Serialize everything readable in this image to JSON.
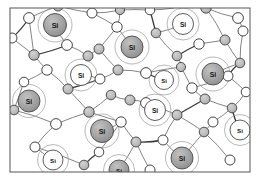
{
  "figure": {
    "atom_label": "Si",
    "frame": {
      "x": 10,
      "y": 8,
      "width": 240,
      "height": 164,
      "stroke": "#555555",
      "fill": "#ffffff"
    },
    "colors": {
      "background": "#ffffff",
      "bond_stroke": "#6e6e6e",
      "bond_stroke_dark": "#3a3a3a",
      "shell_stroke": "#9a9a9a",
      "silicon_fill_dark": "#9e9e9e",
      "silicon_fill_light": "#ffffff",
      "silicon_stroke": "#4a4a4a",
      "dopant_fill": "#b8b8b8",
      "dopant_stroke": "#4a4a4a",
      "hydrogen_fill": "#ffffff",
      "hydrogen_stroke": "#3c3c3c",
      "label_color": "#151515"
    },
    "legend_note": "Large circles labelled Si are silicon atoms; grey small circles and open circles are bonded neighbour sites.",
    "counts": {
      "silicon_filled": 8,
      "silicon_open": 5,
      "small_grey": 23,
      "small_open": 22
    },
    "silicon_atoms": [
      {
        "id": "si-1",
        "cx": 55,
        "cy": 25,
        "r": 11.5,
        "shell": 17,
        "style": "filled"
      },
      {
        "id": "si-2",
        "cx": 132,
        "cy": 47,
        "r": 11.0,
        "shell": 17,
        "style": "filled"
      },
      {
        "id": "si-3",
        "cx": 183,
        "cy": 24,
        "r": 10.5,
        "shell": 16,
        "style": "open"
      },
      {
        "id": "si-4",
        "cx": 81,
        "cy": 75,
        "r": 10.5,
        "shell": 16,
        "style": "open"
      },
      {
        "id": "si-5",
        "cx": 164,
        "cy": 80,
        "r": 9.5,
        "shell": 15,
        "style": "open"
      },
      {
        "id": "si-6",
        "cx": 213,
        "cy": 74,
        "r": 11.0,
        "shell": 17,
        "style": "filled"
      },
      {
        "id": "si-7",
        "cx": 29,
        "cy": 101,
        "r": 11.0,
        "shell": 16.5,
        "style": "filled"
      },
      {
        "id": "si-8",
        "cx": 155,
        "cy": 110,
        "r": 10.5,
        "shell": 16,
        "style": "open"
      },
      {
        "id": "si-9",
        "cx": 102,
        "cy": 131,
        "r": 11.5,
        "shell": 17,
        "style": "filled"
      },
      {
        "id": "si-10",
        "cx": 240,
        "cy": 130,
        "r": 10.0,
        "shell": 15.5,
        "style": "open"
      },
      {
        "id": "si-11",
        "cx": 53,
        "cy": 160,
        "r": 10.0,
        "shell": 15.5,
        "style": "open"
      },
      {
        "id": "si-12",
        "cx": 182,
        "cy": 158,
        "r": 11.0,
        "shell": 16.5,
        "style": "filled"
      },
      {
        "id": "si-13",
        "cx": 119,
        "cy": 170,
        "r": 10.0,
        "shell": 15.5,
        "style": "filled"
      }
    ],
    "grey_sites": [
      {
        "cx": 58,
        "cy": 6,
        "r": 5.0
      },
      {
        "cx": 120,
        "cy": 10,
        "r": 4.6
      },
      {
        "cx": 206,
        "cy": 8,
        "r": 5.2
      },
      {
        "cx": 99,
        "cy": 49,
        "r": 5.0
      },
      {
        "cx": 156,
        "cy": 33,
        "r": 4.8
      },
      {
        "cx": 225,
        "cy": 40,
        "r": 5.0
      },
      {
        "cx": 34,
        "cy": 55,
        "r": 5.2
      },
      {
        "cx": 88,
        "cy": 56,
        "r": 5.0
      },
      {
        "cx": 177,
        "cy": 56,
        "r": 4.8
      },
      {
        "cx": 118,
        "cy": 70,
        "r": 5.0
      },
      {
        "cx": 181,
        "cy": 67,
        "r": 4.6
      },
      {
        "cx": 240,
        "cy": 63,
        "r": 4.8
      },
      {
        "cx": 68,
        "cy": 89,
        "r": 5.0
      },
      {
        "cx": 111,
        "cy": 95,
        "r": 4.8
      },
      {
        "cx": 130,
        "cy": 100,
        "r": 5.0
      },
      {
        "cx": 205,
        "cy": 99,
        "r": 5.0
      },
      {
        "cx": 14,
        "cy": 110,
        "r": 4.8
      },
      {
        "cx": 89,
        "cy": 112,
        "r": 5.2
      },
      {
        "cx": 177,
        "cy": 115,
        "r": 5.0
      },
      {
        "cx": 232,
        "cy": 108,
        "r": 4.8
      },
      {
        "cx": 136,
        "cy": 142,
        "r": 5.0
      },
      {
        "cx": 204,
        "cy": 132,
        "r": 4.8
      },
      {
        "cx": 84,
        "cy": 165,
        "r": 4.8
      }
    ],
    "open_sites": [
      {
        "cx": 29,
        "cy": 18,
        "r": 5.4
      },
      {
        "cx": 92,
        "cy": 13,
        "r": 5.0
      },
      {
        "cx": 150,
        "cy": 10,
        "r": 4.8
      },
      {
        "cx": 238,
        "cy": 18,
        "r": 5.4
      },
      {
        "cx": 12,
        "cy": 38,
        "r": 5.0
      },
      {
        "cx": 67,
        "cy": 45,
        "r": 5.4
      },
      {
        "cx": 117,
        "cy": 27,
        "r": 5.2
      },
      {
        "cx": 199,
        "cy": 44,
        "r": 5.2
      },
      {
        "cx": 243,
        "cy": 31,
        "r": 5.0
      },
      {
        "cx": 47,
        "cy": 70,
        "r": 5.2
      },
      {
        "cx": 146,
        "cy": 73,
        "r": 5.4
      },
      {
        "cx": 228,
        "cy": 76,
        "r": 5.0
      },
      {
        "cx": 24,
        "cy": 82,
        "r": 4.8
      },
      {
        "cx": 100,
        "cy": 79,
        "r": 5.0
      },
      {
        "cx": 192,
        "cy": 88,
        "r": 5.2
      },
      {
        "cx": 146,
        "cy": 103,
        "r": 5.4
      },
      {
        "cx": 246,
        "cy": 92,
        "r": 4.8
      },
      {
        "cx": 56,
        "cy": 124,
        "r": 5.4
      },
      {
        "cx": 121,
        "cy": 122,
        "r": 5.2
      },
      {
        "cx": 213,
        "cy": 122,
        "r": 5.0
      },
      {
        "cx": 163,
        "cy": 140,
        "r": 5.0
      },
      {
        "cx": 35,
        "cy": 147,
        "r": 5.0
      },
      {
        "cx": 99,
        "cy": 152,
        "r": 4.8
      },
      {
        "cx": 230,
        "cy": 160,
        "r": 5.0
      },
      {
        "cx": 150,
        "cy": 170,
        "r": 5.0
      }
    ],
    "bonds": [
      [
        29,
        18,
        12,
        38
      ],
      [
        29,
        18,
        58,
        6
      ],
      [
        29,
        18,
        34,
        55
      ],
      [
        58,
        6,
        92,
        13
      ],
      [
        92,
        13,
        120,
        10
      ],
      [
        120,
        10,
        117,
        27
      ],
      [
        120,
        10,
        150,
        10
      ],
      [
        150,
        10,
        156,
        33
      ],
      [
        150,
        10,
        174,
        8
      ],
      [
        206,
        8,
        238,
        18
      ],
      [
        206,
        8,
        225,
        40
      ],
      [
        238,
        18,
        243,
        31
      ],
      [
        12,
        38,
        34,
        55
      ],
      [
        34,
        55,
        47,
        70
      ],
      [
        34,
        55,
        67,
        45
      ],
      [
        67,
        45,
        88,
        56
      ],
      [
        88,
        56,
        99,
        49
      ],
      [
        99,
        49,
        117,
        27
      ],
      [
        99,
        49,
        118,
        70
      ],
      [
        156,
        33,
        177,
        56
      ],
      [
        177,
        56,
        181,
        67
      ],
      [
        177,
        56,
        199,
        44
      ],
      [
        199,
        44,
        225,
        40
      ],
      [
        225,
        40,
        240,
        63
      ],
      [
        243,
        31,
        240,
        63
      ],
      [
        47,
        70,
        68,
        89
      ],
      [
        47,
        70,
        24,
        82
      ],
      [
        24,
        82,
        14,
        110
      ],
      [
        68,
        89,
        100,
        79
      ],
      [
        100,
        79,
        118,
        70
      ],
      [
        118,
        70,
        146,
        73
      ],
      [
        146,
        73,
        181,
        67
      ],
      [
        181,
        67,
        192,
        88
      ],
      [
        192,
        88,
        205,
        99
      ],
      [
        192,
        88,
        228,
        76
      ],
      [
        228,
        76,
        240,
        63
      ],
      [
        228,
        76,
        246,
        92
      ],
      [
        68,
        89,
        89,
        112
      ],
      [
        89,
        112,
        111,
        95
      ],
      [
        111,
        95,
        130,
        100
      ],
      [
        130,
        100,
        146,
        103
      ],
      [
        146,
        103,
        177,
        115
      ],
      [
        177,
        115,
        205,
        99
      ],
      [
        205,
        99,
        232,
        108
      ],
      [
        232,
        108,
        246,
        92
      ],
      [
        14,
        110,
        56,
        124
      ],
      [
        56,
        124,
        89,
        112
      ],
      [
        89,
        112,
        121,
        122
      ],
      [
        121,
        122,
        136,
        142
      ],
      [
        136,
        142,
        163,
        140
      ],
      [
        163,
        140,
        177,
        115
      ],
      [
        177,
        115,
        204,
        132
      ],
      [
        204,
        132,
        213,
        122
      ],
      [
        213,
        122,
        232,
        108
      ],
      [
        56,
        124,
        35,
        147
      ],
      [
        35,
        147,
        84,
        165
      ],
      [
        84,
        165,
        99,
        152
      ],
      [
        99,
        152,
        121,
        122
      ],
      [
        136,
        142,
        150,
        170
      ],
      [
        163,
        140,
        182,
        158
      ],
      [
        204,
        132,
        230,
        160
      ],
      [
        92,
        13,
        117,
        27
      ],
      [
        117,
        27,
        132,
        47
      ],
      [
        146,
        73,
        164,
        80
      ],
      [
        100,
        79,
        81,
        75
      ],
      [
        67,
        45,
        55,
        25
      ],
      [
        213,
        74,
        240,
        63
      ],
      [
        213,
        74,
        228,
        76
      ],
      [
        155,
        110,
        146,
        103
      ],
      [
        102,
        131,
        121,
        122
      ],
      [
        240,
        130,
        232,
        108
      ],
      [
        53,
        160,
        35,
        147
      ],
      [
        182,
        158,
        204,
        132
      ],
      [
        119,
        170,
        136,
        142
      ],
      [
        29,
        101,
        14,
        110
      ],
      [
        183,
        24,
        156,
        33
      ]
    ]
  }
}
